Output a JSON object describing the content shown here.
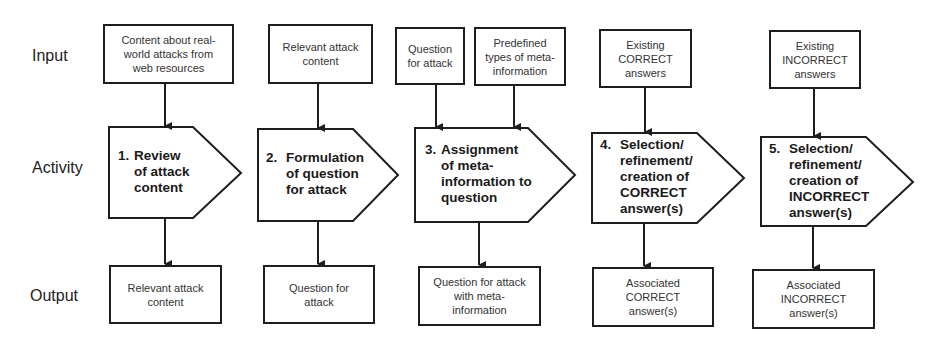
{
  "row_labels": {
    "input": "Input",
    "activity": "Activity",
    "output": "Output"
  },
  "inputs": [
    {
      "text": "Content about real-\nworld attacks from\nweb resources"
    },
    {
      "text": "Relevant attack\ncontent"
    },
    {
      "text": "Question\nfor attack"
    },
    {
      "text": "Predefined\ntypes of meta-\ninformation"
    },
    {
      "text": "Existing\nCORRECT\nanswers"
    },
    {
      "text": "Existing\nINCORRECT\nanswers"
    }
  ],
  "activities": [
    {
      "num": "1.",
      "text": "Review\nof attack\ncontent"
    },
    {
      "num": "2.",
      "text": "Formulation\nof question\nfor attack"
    },
    {
      "num": "3.",
      "text": "Assignment\nof meta-\ninformation to\nquestion"
    },
    {
      "num": "4.",
      "text": "Selection/\nrefinement/\ncreation of\nCORRECT\nanswer(s)"
    },
    {
      "num": "5.",
      "text": "Selection/\nrefinement/\ncreation of\nINCORRECT\nanswer(s)"
    }
  ],
  "outputs": [
    {
      "text": "Relevant attack\ncontent"
    },
    {
      "text": "Question for\nattack"
    },
    {
      "text": "Question for attack\nwith meta-\ninformation"
    },
    {
      "text": "Associated\nCORRECT\nanswer(s)"
    },
    {
      "text": "Associated\nINCORRECT\nanswer(s)"
    }
  ],
  "colors": {
    "stroke": "#1e1e1e",
    "background": "#ffffff"
  }
}
